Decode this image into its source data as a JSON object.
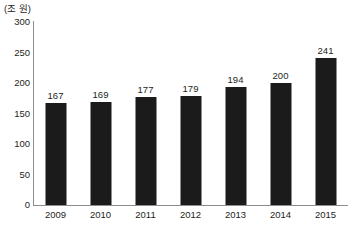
{
  "chart_data": {
    "type": "bar",
    "title": "",
    "subtitle": "",
    "unit_label": "(조 원)",
    "xlabel": "",
    "ylabel": "",
    "categories": [
      "2009",
      "2010",
      "2011",
      "2012",
      "2013",
      "2014",
      "2015"
    ],
    "values": [
      167,
      169,
      177,
      179,
      194,
      200,
      241
    ],
    "value_labels": [
      "167",
      "169",
      "177",
      "179",
      "194",
      "200",
      "241"
    ],
    "ylim": [
      0,
      300
    ],
    "yticks": [
      300,
      250,
      200,
      150,
      100,
      50,
      0
    ],
    "ytick_labels": [
      "300",
      "250",
      "200",
      "150",
      "100",
      "50",
      "0"
    ],
    "grid": false,
    "legend": false,
    "legend_position": "none",
    "series": [
      {
        "name": "",
        "values": [
          167,
          169,
          177,
          179,
          194,
          200,
          241
        ],
        "color": "#1c1b1b"
      }
    ]
  },
  "colors": {
    "bar": "#1c1b1b",
    "axis": "#8d8d8d",
    "text": "#231f20",
    "background": "#ffffff"
  }
}
